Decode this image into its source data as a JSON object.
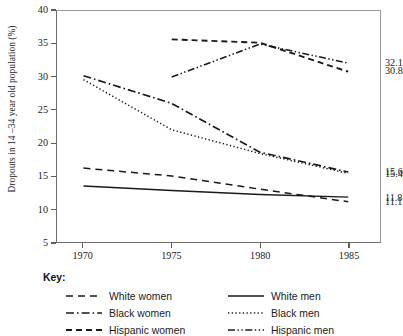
{
  "chart_data": {
    "type": "line",
    "title": "",
    "xlabel": "",
    "ylabel": "Dropouts in 14 –34 year old population (%)",
    "x": [
      1970,
      1975,
      1980,
      1985
    ],
    "xlim": [
      1968.5,
      1986.8
    ],
    "ylim": [
      5,
      40
    ],
    "xticks": [
      "1970",
      "1975",
      "1980",
      "1985"
    ],
    "yticks": [
      "5",
      "10",
      "15",
      "20",
      "25",
      "30",
      "35",
      "40"
    ],
    "grid": false,
    "legend_position": "below",
    "series": [
      {
        "name": "White women",
        "style": "dashed",
        "x": [
          1970,
          1975,
          1980,
          1985
        ],
        "values": [
          16.2,
          15.0,
          13.0,
          11.1
        ],
        "end_label": "11.1"
      },
      {
        "name": "Black women",
        "style": "dash-dot",
        "x": [
          1970,
          1975,
          1980,
          1985
        ],
        "values": [
          30.2,
          26.0,
          18.6,
          15.6
        ],
        "end_label": "15.6"
      },
      {
        "name": "Hispanic women",
        "style": "dashed-heavy",
        "x": [
          1975,
          1980,
          1985
        ],
        "values": [
          35.7,
          35.2,
          30.8
        ],
        "end_label": "30.8"
      },
      {
        "name": "White men",
        "style": "solid",
        "x": [
          1970,
          1975,
          1980,
          1985
        ],
        "values": [
          13.5,
          12.8,
          12.2,
          11.8
        ],
        "end_label": "11.8"
      },
      {
        "name": "Black men",
        "style": "dotted",
        "x": [
          1970,
          1975,
          1980,
          1985
        ],
        "values": [
          29.6,
          22.0,
          18.4,
          15.4
        ],
        "end_label": "15.4"
      },
      {
        "name": "Hispanic men",
        "style": "dash-dot-dot",
        "x": [
          1975,
          1980,
          1985
        ],
        "values": [
          30.0,
          35.0,
          32.1
        ],
        "end_label": "32.1"
      }
    ],
    "end_labels": [
      {
        "text": "32.1",
        "value": 32.1
      },
      {
        "text": "30.8",
        "value": 30.8
      },
      {
        "text": "15.6",
        "value": 15.6
      },
      {
        "text": "15.4",
        "value": 15.4
      },
      {
        "text": "11.8",
        "value": 11.8
      },
      {
        "text": "11.1",
        "value": 11.1
      }
    ]
  },
  "legend": {
    "title": "Key:",
    "left_column": [
      {
        "label": "White women",
        "style": "dashed"
      },
      {
        "label": "Black women",
        "style": "dash-dot"
      },
      {
        "label": "Hispanic women",
        "style": "dashed-heavy"
      }
    ],
    "right_column": [
      {
        "label": "White men",
        "style": "solid"
      },
      {
        "label": "Black men",
        "style": "dotted"
      },
      {
        "label": "Hispanic men",
        "style": "dash-dot-dot"
      }
    ]
  }
}
